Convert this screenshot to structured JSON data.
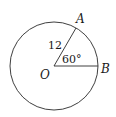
{
  "diagram": {
    "type": "circle-sector-geometry",
    "circle": {
      "center_label": "O",
      "radius_value": "12"
    },
    "points": {
      "A": "A",
      "B": "B",
      "O": "O"
    },
    "angle": {
      "label": "60°",
      "degrees": 60
    },
    "radius_label": "12",
    "colors": {
      "stroke": "#2a2a2a",
      "text": "#1a1a1a",
      "background": "#ffffff"
    }
  }
}
